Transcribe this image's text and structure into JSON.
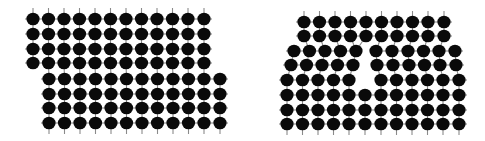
{
  "figure": {
    "colors": {
      "atom": "#0a0a0a",
      "bond": "#8a8a8a",
      "background": "#ffffff"
    },
    "atom_radius": 6.6,
    "bond_width": 1.1,
    "stub_length": 8
  },
  "panels": [
    {
      "id": "left-lattice",
      "label": "offset-lattice",
      "rows": [
        {
          "y": 19,
          "xs": [
            33,
            48.5,
            64,
            79.5,
            95,
            110.5,
            126,
            141.5,
            157,
            172.5,
            188,
            204
          ]
        },
        {
          "y": 34,
          "xs": [
            33,
            48.5,
            64,
            79.5,
            95,
            110.5,
            126,
            141.5,
            157,
            172.5,
            188,
            204
          ]
        },
        {
          "y": 49,
          "xs": [
            33,
            48.5,
            64,
            79.5,
            95,
            110.5,
            126,
            141.5,
            157,
            172.5,
            188,
            204
          ]
        },
        {
          "y": 63,
          "xs": [
            33,
            48.5,
            64,
            79.5,
            95,
            110.5,
            126,
            141.5,
            157,
            172.5,
            188,
            204
          ]
        },
        {
          "y": 79,
          "xs": [
            49,
            64.5,
            80,
            95.5,
            111,
            126.5,
            142,
            157.5,
            173,
            188.5,
            204,
            220
          ]
        },
        {
          "y": 94,
          "xs": [
            49,
            64.5,
            80,
            95.5,
            111,
            126.5,
            142,
            157.5,
            173,
            188.5,
            204,
            220
          ]
        },
        {
          "y": 108,
          "xs": [
            49,
            64.5,
            80,
            95.5,
            111,
            126.5,
            142,
            157.5,
            173,
            188.5,
            204,
            220
          ]
        },
        {
          "y": 123,
          "xs": [
            49,
            64.5,
            80,
            95.5,
            111,
            126.5,
            142,
            157.5,
            173,
            188.5,
            204,
            220
          ]
        }
      ]
    },
    {
      "id": "right-lattice",
      "label": "vacancy-lattice",
      "rows": [
        {
          "y": 22,
          "xs": [
            304,
            319.5,
            335,
            350.5,
            366,
            381.5,
            397,
            412.5,
            428,
            444
          ]
        },
        {
          "y": 36,
          "xs": [
            304,
            319.5,
            335,
            350.5,
            366,
            381.5,
            397,
            412.5,
            428,
            444
          ]
        },
        {
          "y": 51,
          "xs": [
            294,
            309.5,
            325,
            340.5,
            356,
            376,
            392,
            408,
            423.5,
            439,
            455
          ]
        },
        {
          "y": 65,
          "xs": [
            291,
            306.5,
            322,
            337.5,
            353,
            377,
            393,
            409,
            424.5,
            440,
            456
          ]
        },
        {
          "y": 80,
          "xs": [
            287,
            302.5,
            318,
            333.5,
            349,
            381,
            396.5,
            412,
            427.5,
            443,
            459
          ]
        },
        {
          "y": 95,
          "xs": [
            287,
            302.5,
            318,
            333.5,
            349,
            365,
            381,
            396.5,
            412,
            427.5,
            443,
            459
          ]
        },
        {
          "y": 110,
          "xs": [
            287,
            302.5,
            318,
            333.5,
            349,
            365,
            381,
            396.5,
            412,
            427.5,
            443,
            459
          ]
        },
        {
          "y": 124,
          "xs": [
            287,
            302.5,
            318,
            333.5,
            349,
            365,
            381,
            396.5,
            412,
            427.5,
            443,
            459
          ]
        }
      ]
    }
  ]
}
